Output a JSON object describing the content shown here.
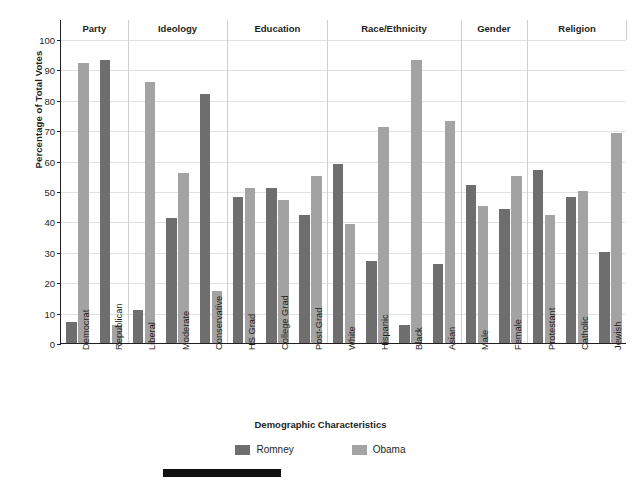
{
  "chart_data": {
    "type": "bar",
    "title": "",
    "xlabel": "Demographic Characteristics",
    "ylabel": "Percentage of Total Votes",
    "ylim": [
      0,
      100
    ],
    "ytick_step": 10,
    "yticks": [
      0,
      10,
      20,
      30,
      40,
      50,
      60,
      70,
      80,
      90,
      100
    ],
    "grid": true,
    "legend_position": "bottom-center",
    "categories": [
      "Democrat",
      "Republican",
      "Liberal",
      "Moderate",
      "Conservative",
      "HS Grad",
      "College Grad",
      "Post-Grad",
      "White",
      "Hispanic",
      "Black",
      "Asian",
      "Male",
      "Female",
      "Protestant",
      "Catholic",
      "Jewish"
    ],
    "series": [
      {
        "name": "Romney",
        "color": "#6e6e6e",
        "values": [
          7,
          93,
          11,
          41,
          82,
          48,
          51,
          42,
          59,
          27,
          6,
          26,
          52,
          44,
          57,
          48,
          30
        ]
      },
      {
        "name": "Obama",
        "color": "#a3a3a3",
        "values": [
          92,
          6,
          86,
          56,
          17,
          51,
          47,
          55,
          39,
          71,
          93,
          73,
          45,
          55,
          42,
          50,
          69
        ]
      }
    ],
    "groups": [
      {
        "label": "Party",
        "categories": [
          "Democrat",
          "Republican"
        ]
      },
      {
        "label": "Ideology",
        "categories": [
          "Liberal",
          "Moderate",
          "Conservative"
        ]
      },
      {
        "label": "Education",
        "categories": [
          "HS Grad",
          "College Grad",
          "Post-Grad"
        ]
      },
      {
        "label": "Race/Ethnicity",
        "categories": [
          "White",
          "Hispanic",
          "Black",
          "Asian"
        ]
      },
      {
        "label": "Gender",
        "categories": [
          "Male",
          "Female"
        ]
      },
      {
        "label": "Religion",
        "categories": [
          "Protestant",
          "Catholic",
          "Jewish"
        ]
      }
    ]
  }
}
